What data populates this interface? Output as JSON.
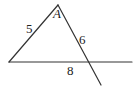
{
  "diagram": {
    "type": "geometry-triangle",
    "colors": {
      "line": "#333333",
      "text": "#222222",
      "background": "#ffffff"
    },
    "points": {
      "apex": {
        "name": "A",
        "x": 58,
        "y": 5
      },
      "left": {
        "x": 9,
        "y": 62
      },
      "intersection": {
        "x": 88,
        "y": 62
      },
      "line_right_end": {
        "x": 132,
        "y": 62
      },
      "extension_end": {
        "x": 101,
        "y": 85
      }
    },
    "labels": {
      "vertex_a": "A",
      "side_left": "5",
      "side_right": "6",
      "side_bottom": "8"
    }
  }
}
